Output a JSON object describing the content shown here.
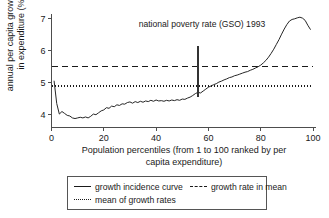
{
  "chart_data": {
    "type": "line",
    "title": "",
    "xlabel": "Population percentiles (from 1 to 100 ranked by per capita expenditure)",
    "xlabel_line1": "Population percentiles (from 1 to 100 ranked by per",
    "xlabel_line2": "capita expenditure)",
    "ylabel": "annual per capita growth rate in expenditure (%)",
    "ylabel_line1": "annual per capita growth rate",
    "ylabel_line2": "in expenditure (%)",
    "xlim": [
      0,
      100
    ],
    "ylim": [
      3.6,
      7.15
    ],
    "xticks": [
      0,
      20,
      40,
      60,
      80,
      100
    ],
    "yticks": [
      4,
      5,
      6,
      7
    ],
    "grid": false,
    "legend_position": "below-axes",
    "annotations": [
      {
        "text": "national poverty rate (GSO) 1993",
        "x": 56,
        "marker_y_top": 6.15,
        "marker_y_bottom": 4.55
      }
    ],
    "reference_lines": [
      {
        "name": "growth rate in mean",
        "value": 5.5,
        "style": "dashed"
      },
      {
        "name": "mean of growth rates",
        "value": 4.9,
        "style": "dotted"
      }
    ],
    "series": [
      {
        "name": "growth incidence curve",
        "style": "solid",
        "x": [
          1,
          2,
          3,
          4,
          5,
          6,
          7,
          8,
          9,
          10,
          11,
          12,
          13,
          14,
          15,
          16,
          17,
          18,
          19,
          20,
          21,
          22,
          23,
          24,
          25,
          26,
          27,
          28,
          29,
          30,
          31,
          32,
          33,
          34,
          35,
          36,
          37,
          38,
          39,
          40,
          41,
          42,
          43,
          44,
          45,
          46,
          47,
          48,
          49,
          50,
          51,
          52,
          53,
          54,
          55,
          56,
          57,
          58,
          59,
          60,
          61,
          62,
          63,
          64,
          65,
          66,
          67,
          68,
          69,
          70,
          71,
          72,
          73,
          74,
          75,
          76,
          77,
          78,
          79,
          80,
          81,
          82,
          83,
          84,
          85,
          86,
          87,
          88,
          89,
          90,
          91,
          92,
          93,
          94,
          95,
          96,
          97,
          98,
          99
        ],
        "values": [
          5.05,
          4.35,
          4.02,
          4.1,
          4.04,
          3.98,
          3.96,
          3.9,
          3.88,
          3.9,
          3.92,
          3.9,
          3.93,
          3.9,
          3.95,
          4.02,
          4.0,
          4.06,
          4.12,
          4.15,
          4.22,
          4.2,
          4.27,
          4.25,
          4.31,
          4.29,
          4.34,
          4.33,
          4.38,
          4.4,
          4.36,
          4.41,
          4.38,
          4.42,
          4.39,
          4.43,
          4.41,
          4.45,
          4.42,
          4.46,
          4.43,
          4.44,
          4.42,
          4.45,
          4.43,
          4.46,
          4.44,
          4.47,
          4.45,
          4.49,
          4.48,
          4.52,
          4.55,
          4.6,
          4.66,
          4.7,
          4.68,
          4.74,
          4.8,
          4.86,
          4.9,
          4.94,
          4.97,
          5.02,
          5.05,
          5.09,
          5.12,
          5.16,
          5.18,
          5.22,
          5.24,
          5.27,
          5.3,
          5.33,
          5.35,
          5.39,
          5.42,
          5.46,
          5.5,
          5.55,
          5.62,
          5.7,
          5.8,
          5.92,
          6.05,
          6.2,
          6.35,
          6.52,
          6.68,
          6.82,
          6.93,
          6.98,
          7.0,
          7.03,
          7.05,
          7.02,
          6.95,
          6.8,
          6.67
        ]
      }
    ],
    "legend": [
      {
        "label": "growth incidence curve",
        "style": "solid"
      },
      {
        "label": "growth rate in mean",
        "style": "dashed"
      },
      {
        "label": "mean of growth rates",
        "style": "dotted"
      }
    ]
  }
}
